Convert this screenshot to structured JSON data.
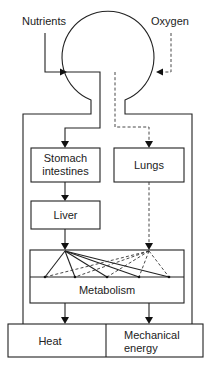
{
  "diagram": {
    "inputs": {
      "nutrients": "Nutrients",
      "oxygen": "Oxygen"
    },
    "boxes": {
      "stomach_line1": "Stomach",
      "stomach_line2": "intestines",
      "lungs": "Lungs",
      "liver": "Liver",
      "metabolism": "Metabolism",
      "heat": "Heat",
      "mechanical_line1": "Mechanical",
      "mechanical_line2": "energy"
    },
    "metabolism_targets_x": [
      45,
      75,
      107,
      139,
      169
    ],
    "line_styles": {
      "nutrient_path": "solid",
      "oxygen_path": "dashed"
    }
  }
}
